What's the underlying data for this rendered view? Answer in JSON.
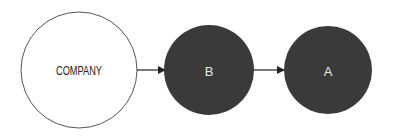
{
  "diagram": {
    "nodes": [
      {
        "id": "company",
        "label": "COMPANY",
        "fill": "#ffffff",
        "stroke": "#555555",
        "text_color": "#222222"
      },
      {
        "id": "b",
        "label": "B",
        "fill": "#3a3a3a",
        "stroke": "#3a3a3a",
        "text_color": "#e8e8e8"
      },
      {
        "id": "a",
        "label": "A",
        "fill": "#3a3a3a",
        "stroke": "#3a3a3a",
        "text_color": "#e8e8e8"
      }
    ],
    "edges": [
      {
        "from": "company",
        "to": "b"
      },
      {
        "from": "b",
        "to": "a"
      }
    ]
  }
}
